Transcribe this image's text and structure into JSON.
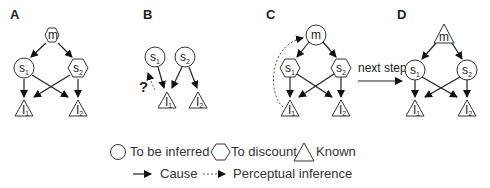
{
  "panels": [
    {
      "label": "A",
      "m_shape": "hexagon",
      "s1_shape": "circle",
      "s2_shape": "hexagon"
    },
    {
      "label": "B",
      "s1_shape": "circle",
      "s2_shape": "circle",
      "question": "?"
    },
    {
      "label": "C",
      "m_shape": "circle",
      "s1_shape": "hexagon",
      "s2_shape": "hexagon"
    },
    {
      "label": "D",
      "m_shape": "triangle",
      "s1_shape": "circle",
      "s2_shape": "circle"
    }
  ],
  "nodes": {
    "m": "m",
    "s": "s",
    "I": "I",
    "sub1": "1",
    "sub2": "2"
  },
  "transition": {
    "label": "next step"
  },
  "legend": {
    "shapes": [
      {
        "icon": "circle-icon",
        "label": "To be inferred"
      },
      {
        "icon": "hexagon-icon",
        "label": "To discount"
      },
      {
        "icon": "triangle-icon",
        "label": "Known"
      }
    ],
    "arrows": [
      {
        "icon": "solid-arrow-icon",
        "label": "Cause"
      },
      {
        "icon": "dashed-arrow-icon",
        "label": "Perceptual inference"
      }
    ]
  }
}
